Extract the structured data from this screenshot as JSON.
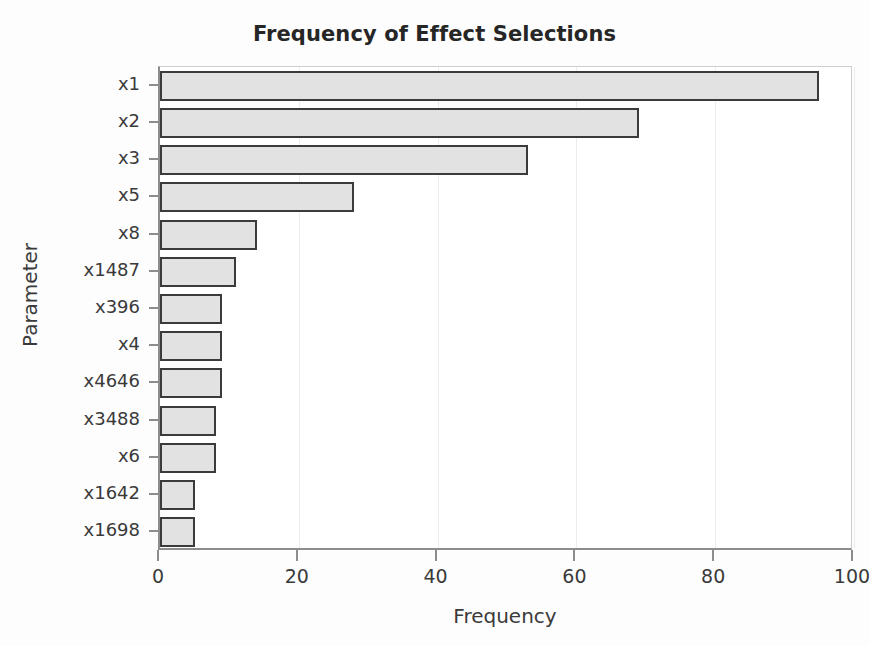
{
  "chart_data": {
    "type": "bar",
    "orientation": "horizontal",
    "title": "Frequency of Effect Selections",
    "xlabel": "Frequency",
    "ylabel": "Parameter",
    "categories": [
      "x1",
      "x2",
      "x3",
      "x5",
      "x8",
      "x1487",
      "x396",
      "x4",
      "x4646",
      "x3488",
      "x6",
      "x1642",
      "x1698"
    ],
    "values": [
      95,
      69,
      53,
      28,
      14,
      11,
      9,
      9,
      9,
      8,
      8,
      5,
      5
    ],
    "xlim": [
      0,
      100
    ],
    "xticks": [
      0,
      20,
      40,
      60,
      80,
      100
    ],
    "xtick_labels": [
      "0",
      "20",
      "40",
      "60",
      "80",
      "100"
    ],
    "grid": true,
    "legend": null,
    "bar_fill_color": "#e2e2e2",
    "bar_edge_color": "#3b3b3b",
    "axis_color": "#8d8d8d",
    "background_color": "#ffffff"
  }
}
